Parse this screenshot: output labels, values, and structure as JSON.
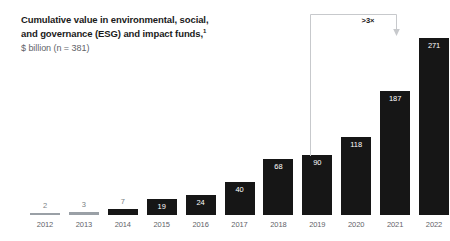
{
  "header": {
    "title_line1": "Cumulative value in environmental, social,",
    "title_line2": "and governance (ESG) and impact funds,",
    "footnote_marker": "1",
    "subtitle": "$ billion (n = 381)"
  },
  "annotation": {
    "label": ">3×",
    "from_category": "2019",
    "to_category": "2022"
  },
  "colors": {
    "bar": "#161616",
    "bar_muted": "#9aa0a6",
    "title": "#1a1a1a",
    "subtitle": "#5f6369",
    "axis_label": "#5f6369",
    "value_inside": "#ffffff",
    "value_outside": "#7a7f85",
    "annotation_line": "#c7c9cc",
    "background": "#ffffff"
  },
  "chart_data": {
    "type": "bar",
    "subtitle": "$ billion (n = 381)",
    "xlabel": "",
    "ylabel": "$ billion",
    "ylim": [
      0,
      271
    ],
    "grid": false,
    "legend": null,
    "categories": [
      "2012",
      "2013",
      "2014",
      "2015",
      "2016",
      "2017",
      "2018",
      "2019",
      "2020",
      "2021",
      "2022"
    ],
    "values": [
      2,
      3,
      7,
      19,
      24,
      40,
      68,
      90,
      118,
      187,
      271
    ],
    "annotations": [
      {
        "text": ">3×",
        "type": "bracket-arrow",
        "from": "2019",
        "to": "2022"
      }
    ]
  },
  "bars": [
    {
      "year": "2012",
      "value": "2",
      "px_height": 2,
      "style": "muted",
      "label_pos": "outside"
    },
    {
      "year": "2013",
      "value": "3",
      "px_height": 3,
      "style": "muted",
      "label_pos": "outside"
    },
    {
      "year": "2014",
      "value": "7",
      "px_height": 6,
      "style": "normal",
      "label_pos": "outside"
    },
    {
      "year": "2015",
      "value": "19",
      "px_height": 16,
      "style": "normal",
      "label_pos": "inside"
    },
    {
      "year": "2016",
      "value": "24",
      "px_height": 20,
      "style": "normal",
      "label_pos": "inside"
    },
    {
      "year": "2017",
      "value": "40",
      "px_height": 33,
      "style": "normal",
      "label_pos": "inside"
    },
    {
      "year": "2018",
      "value": "68",
      "px_height": 56,
      "style": "normal",
      "label_pos": "inside"
    },
    {
      "year": "2019",
      "value": "90",
      "px_height": 60,
      "style": "normal",
      "label_pos": "inside"
    },
    {
      "year": "2020",
      "value": "118",
      "px_height": 78,
      "style": "normal",
      "label_pos": "inside"
    },
    {
      "year": "2021",
      "value": "187",
      "px_height": 124,
      "style": "normal",
      "label_pos": "inside"
    },
    {
      "year": "2022",
      "value": "271",
      "px_height": 177,
      "style": "normal",
      "label_pos": "inside"
    }
  ]
}
